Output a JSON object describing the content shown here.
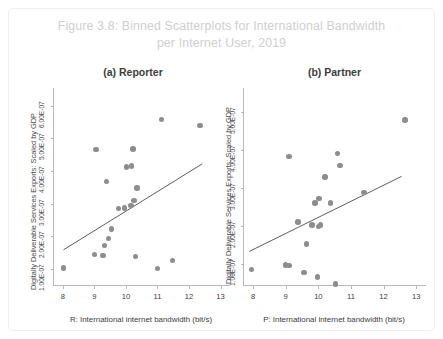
{
  "figure": {
    "title": "Figure 3.8: Binned Scatterplots for International Bandwidth per Internet User, 2019",
    "title_line1": "Figure 3.8: Binned Scatterplots for International Bandwidth",
    "title_line2": "per Internet User, 2019",
    "title_color": "#cfcfcf",
    "dot_color": "#8d8d8d",
    "axis_color": "#b9b9b9",
    "line_color": "#5f5f5f",
    "background": "#ffffff"
  },
  "chart_data": [
    {
      "type": "scatter",
      "title": "(a) Reporter",
      "xlabel": "R: International internet bandwidth (bit/s)",
      "ylabel": "Digitally Deliverable Services Exports: Scaled by GDP",
      "xlim": [
        7.72,
        13.3
      ],
      "ylim": [
        5e-08,
        6.55e-07
      ],
      "xticks": [
        8,
        9,
        10,
        11,
        12,
        13
      ],
      "xticklabels": [
        "8",
        "9",
        "10",
        "11",
        "12",
        "13"
      ],
      "yticks": [
        1e-07,
        2e-07,
        3e-07,
        4e-07,
        5e-07,
        6e-07
      ],
      "yticklabels": [
        "1.00E-07",
        "2.00E-07",
        "3.00E-07",
        "4.00E-07",
        "5.00E-07",
        "6.00E-07"
      ],
      "grid": false,
      "legend": "none",
      "points": [
        {
          "x": 8.02,
          "y": 1.02e-07
        },
        {
          "x": 9.0,
          "y": 1.44e-07
        },
        {
          "x": 9.27,
          "y": 1.4e-07
        },
        {
          "x": 9.33,
          "y": 1.72e-07
        },
        {
          "x": 9.44,
          "y": 1.92e-07
        },
        {
          "x": 9.55,
          "y": 2.22e-07
        },
        {
          "x": 9.38,
          "y": 3.68e-07
        },
        {
          "x": 9.05,
          "y": 4.66e-07
        },
        {
          "x": 9.76,
          "y": 2.85e-07
        },
        {
          "x": 9.95,
          "y": 2.86e-07
        },
        {
          "x": 10.16,
          "y": 2.95e-07
        },
        {
          "x": 10.25,
          "y": 3.09e-07
        },
        {
          "x": 10.02,
          "y": 4.12e-07
        },
        {
          "x": 10.18,
          "y": 4.16e-07
        },
        {
          "x": 10.35,
          "y": 3.48e-07
        },
        {
          "x": 10.22,
          "y": 4.68e-07
        },
        {
          "x": 10.3,
          "y": 1.38e-07
        },
        {
          "x": 11.0,
          "y": 1e-07
        },
        {
          "x": 11.12,
          "y": 5.58e-07
        },
        {
          "x": 11.48,
          "y": 1.25e-07
        },
        {
          "x": 12.35,
          "y": 5.4e-07
        }
      ],
      "fit_line": {
        "x0": 8.02,
        "y0": 1.58e-07,
        "x1": 12.42,
        "y1": 4.22e-07
      }
    },
    {
      "type": "scatter",
      "title": "(b) Partner",
      "xlabel": "P: International internet bandwidth (bit/s)",
      "ylabel": "Digitally Deliverable Services Exports: Scaled by GDP",
      "xlim": [
        7.72,
        13.3
      ],
      "ylim": [
        4.5e-08,
        5.62e-07
      ],
      "xticks": [
        8,
        9,
        10,
        11,
        12,
        13
      ],
      "xticklabels": [
        "8",
        "9",
        "10",
        "11",
        "12",
        "13"
      ],
      "yticks": [
        1e-07,
        2e-07,
        3e-07,
        4e-07,
        5e-07
      ],
      "yticklabels": [
        "1.00E-07",
        "2.00E-07",
        "3.00E-07",
        "4.00E-07",
        "5.00E-07"
      ],
      "grid": false,
      "legend": "none",
      "points": [
        {
          "x": 7.95,
          "y": 8.6e-08
        },
        {
          "x": 9.0,
          "y": 9.8e-08
        },
        {
          "x": 9.1,
          "y": 9.6e-08
        },
        {
          "x": 9.56,
          "y": 7.8e-08
        },
        {
          "x": 9.97,
          "y": 6.6e-08
        },
        {
          "x": 10.52,
          "y": 4.8e-08
        },
        {
          "x": 9.38,
          "y": 2.1e-07
        },
        {
          "x": 9.63,
          "y": 1.53e-07
        },
        {
          "x": 9.8,
          "y": 2.02e-07
        },
        {
          "x": 10.0,
          "y": 1.98e-07
        },
        {
          "x": 10.07,
          "y": 2.02e-07
        },
        {
          "x": 9.9,
          "y": 2.6e-07
        },
        {
          "x": 10.02,
          "y": 2.72e-07
        },
        {
          "x": 10.37,
          "y": 2.6e-07
        },
        {
          "x": 10.2,
          "y": 3.28e-07
        },
        {
          "x": 10.58,
          "y": 3.9e-07
        },
        {
          "x": 10.66,
          "y": 3.58e-07
        },
        {
          "x": 9.1,
          "y": 3.83e-07
        },
        {
          "x": 11.4,
          "y": 2.88e-07
        },
        {
          "x": 12.66,
          "y": 4.78e-07
        }
      ],
      "fit_line": {
        "x0": 7.88,
        "y0": 1.33e-07,
        "x1": 12.55,
        "y1": 3.3e-07
      }
    }
  ]
}
